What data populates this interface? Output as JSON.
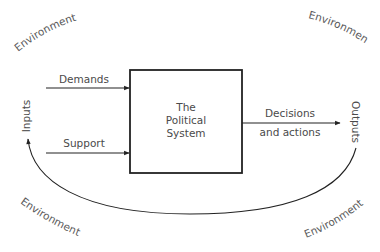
{
  "diagram": {
    "center_box": {
      "lines": [
        "The",
        "Political",
        "System"
      ]
    },
    "inputs_label": "Inputs",
    "outputs_label": "Outputs",
    "input_arrows": [
      {
        "label": "Demands"
      },
      {
        "label": "Support"
      }
    ],
    "output_arrow": {
      "label_line1": "Decisions",
      "label_line2": "and actions"
    },
    "feedback_loop": {
      "from": "Outputs",
      "to": "Inputs"
    },
    "environment_labels": [
      {
        "position": "top-left",
        "text": "Environment"
      },
      {
        "position": "top-right",
        "text": "Environment"
      },
      {
        "position": "bottom-left",
        "text": "Environment"
      },
      {
        "position": "bottom-right",
        "text": "Environment"
      }
    ],
    "colors": {
      "line": "#222222",
      "text": "#4a4a4a",
      "background": "#ffffff"
    }
  }
}
